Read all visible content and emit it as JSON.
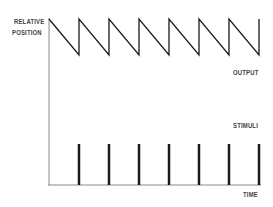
{
  "labels": {
    "y_axis_line1": "RELATIVE",
    "y_axis_line2": "POSITION",
    "output": "OUTPUT",
    "stimuli": "STIMULI",
    "x_axis": "TIME"
  },
  "colors": {
    "line": "#1a1a1a",
    "axis": "#888888",
    "text": "#444444"
  },
  "diagram": {
    "output_waveform": "sawtooth",
    "sawtooth_peaks_x": [
      49,
      79,
      109,
      139,
      169,
      199,
      229,
      259
    ],
    "stimuli_count": 7,
    "stimuli_x": [
      79,
      109,
      139,
      169,
      199,
      229,
      259
    ]
  }
}
